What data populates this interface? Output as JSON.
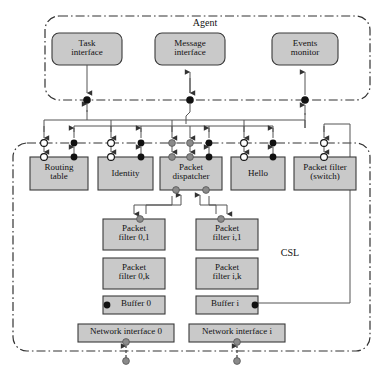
{
  "diagram": {
    "type": "architecture-block-diagram",
    "regions": [
      {
        "id": "agent",
        "label": "Agent",
        "border": "dash-dot",
        "shape": "rounded"
      },
      {
        "id": "csl",
        "label": "CSL",
        "border": "dash-dot",
        "shape": "rounded"
      }
    ],
    "colors": {
      "box_fill": "#c9c9c9",
      "box_stroke": "#3a3a3a",
      "line": "#5a5a5a",
      "port_black": "#111111",
      "port_white": "#ffffff",
      "port_gray": "#8a8a8a",
      "region_border": "#333333",
      "background": "#ffffff"
    },
    "agent_boxes": [
      {
        "id": "task-interface",
        "label": "Task\ninterface",
        "x": 52,
        "y": 33,
        "w": 70,
        "h": 32
      },
      {
        "id": "message-interface",
        "label": "Message\ninterface",
        "x": 155,
        "y": 33,
        "w": 70,
        "h": 32
      },
      {
        "id": "events-monitor",
        "label": "Events\nmonitor",
        "x": 272,
        "y": 33,
        "w": 66,
        "h": 32
      }
    ],
    "csl_top_boxes": [
      {
        "id": "routing-table",
        "label": "Routing\ntable",
        "x": 30,
        "y": 157,
        "w": 58,
        "h": 33
      },
      {
        "id": "identity",
        "label": "Identity",
        "x": 98,
        "y": 157,
        "w": 55,
        "h": 33
      },
      {
        "id": "packet-dispatcher",
        "label": "Packet\ndispatcher",
        "x": 160,
        "y": 157,
        "w": 62,
        "h": 33
      },
      {
        "id": "hello",
        "label": "Hello",
        "x": 231,
        "y": 157,
        "w": 54,
        "h": 33
      },
      {
        "id": "packet-filter-switch",
        "label": "Packet filter\n(switch)",
        "x": 294,
        "y": 157,
        "w": 62,
        "h": 33
      }
    ],
    "csl_stack_boxes": [
      {
        "id": "packet-filter-0-1",
        "label": "Packet\nfilter 0,1",
        "x": 103,
        "y": 219,
        "w": 62,
        "h": 31
      },
      {
        "id": "packet-filter-i-1",
        "label": "Packet\nfilter i,1",
        "x": 196,
        "y": 219,
        "w": 62,
        "h": 31
      },
      {
        "id": "packet-filter-0-k",
        "label": "Packet\nfilter 0,k",
        "x": 103,
        "y": 258,
        "w": 62,
        "h": 31
      },
      {
        "id": "packet-filter-i-k",
        "label": "Packet\nfilter i,k",
        "x": 196,
        "y": 258,
        "w": 62,
        "h": 31
      },
      {
        "id": "buffer-0",
        "label": "Buffer 0",
        "x": 103,
        "y": 296,
        "w": 62,
        "h": 18
      },
      {
        "id": "buffer-i",
        "label": "Buffer i",
        "x": 196,
        "y": 296,
        "w": 62,
        "h": 18
      },
      {
        "id": "network-interface-0",
        "label": "Network interface 0",
        "x": 78,
        "y": 324,
        "w": 96,
        "h": 18
      },
      {
        "id": "network-interface-i",
        "label": "Network interface i",
        "x": 189,
        "y": 324,
        "w": 96,
        "h": 18
      }
    ],
    "connector_ports": [
      {
        "id": "agent-port-task",
        "x": 87,
        "y": 100,
        "color": "black"
      },
      {
        "id": "agent-port-message",
        "x": 190,
        "y": 100,
        "color": "black"
      },
      {
        "id": "agent-port-events",
        "x": 305,
        "y": 100,
        "color": "black"
      },
      {
        "id": "csl-port-routing-in",
        "x": 44,
        "y": 143,
        "color": "white"
      },
      {
        "id": "csl-port-routing-out",
        "x": 74,
        "y": 143,
        "color": "black"
      },
      {
        "id": "csl-port-identity-in",
        "x": 111,
        "y": 143,
        "color": "white"
      },
      {
        "id": "csl-port-identity-out",
        "x": 141,
        "y": 143,
        "color": "black"
      },
      {
        "id": "csl-port-dispatch-1",
        "x": 172,
        "y": 143,
        "color": "gray"
      },
      {
        "id": "csl-port-dispatch-2",
        "x": 190,
        "y": 143,
        "color": "gray"
      },
      {
        "id": "csl-port-dispatch-3",
        "x": 209,
        "y": 143,
        "color": "black"
      },
      {
        "id": "csl-port-hello-in",
        "x": 244,
        "y": 143,
        "color": "white"
      },
      {
        "id": "csl-port-hello-out",
        "x": 273,
        "y": 143,
        "color": "black"
      },
      {
        "id": "csl-port-switch",
        "x": 324,
        "y": 143,
        "color": "white"
      },
      {
        "id": "ni0-bottom-port",
        "x": 126,
        "y": 361,
        "color": "gray"
      },
      {
        "id": "nii-bottom-port",
        "x": 237,
        "y": 361,
        "color": "gray"
      }
    ],
    "edges": [
      {
        "from": "task-interface",
        "to": "agent-port-task",
        "arrow": "down"
      },
      {
        "from": "agent-port-task",
        "to": "csl-bus",
        "arrow": "down"
      },
      {
        "from": "message-interface",
        "to": "agent-port-message",
        "arrow": "bidirectional"
      },
      {
        "from": "events-monitor",
        "to": "agent-port-events",
        "arrow": "up"
      },
      {
        "from": "packet-dispatcher",
        "to": "packet-filter-0-1",
        "arrow": "bidirectional"
      },
      {
        "from": "packet-dispatcher",
        "to": "packet-filter-i-1",
        "arrow": "bidirectional"
      },
      {
        "from": "buffer-i",
        "to": "packet-filter-switch",
        "arrow": "line"
      },
      {
        "from": "network-interface-0",
        "to": "nii-external",
        "arrow": "bidirectional"
      },
      {
        "from": "network-interface-i",
        "to": "nii-external",
        "arrow": "bidirectional"
      }
    ]
  }
}
